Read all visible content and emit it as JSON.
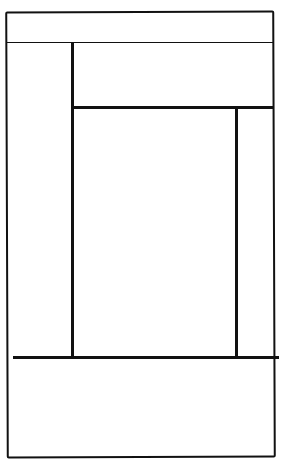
{
  "wireframe": {
    "type": "hand-drawn layout sketch",
    "stroke_color": "#111111",
    "background": "#ffffff",
    "regions": [
      {
        "id": "header",
        "label": ""
      },
      {
        "id": "sidebar",
        "label": ""
      },
      {
        "id": "top-panel",
        "label": ""
      },
      {
        "id": "content",
        "label": ""
      },
      {
        "id": "right-panel",
        "label": ""
      },
      {
        "id": "footer",
        "label": ""
      }
    ]
  }
}
